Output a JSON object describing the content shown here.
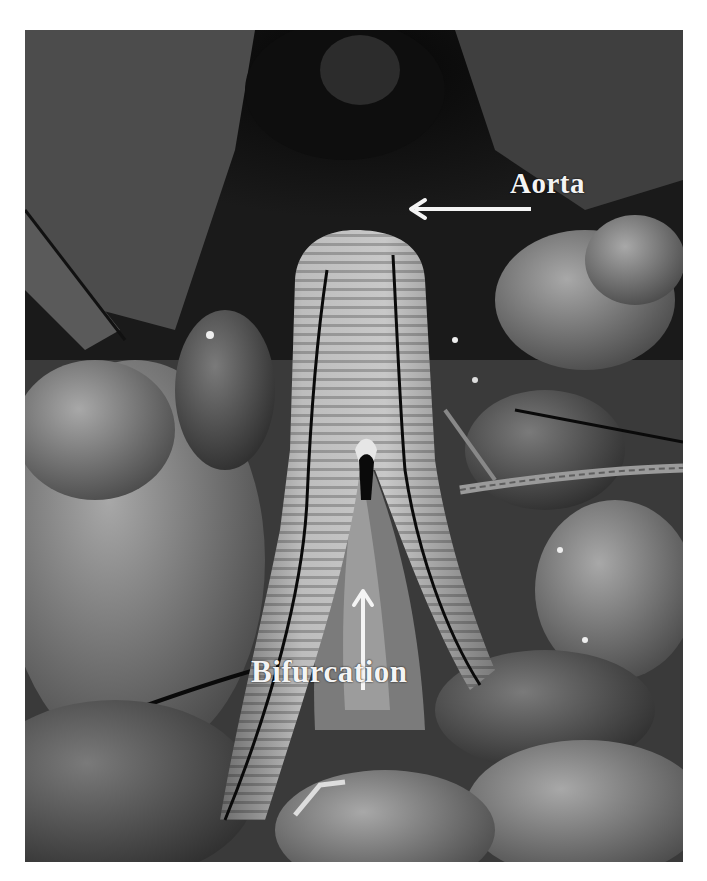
{
  "figure": {
    "type": "grayscale intraoperative photograph",
    "annotations": [
      {
        "id": "aorta",
        "text": "Aorta",
        "arrow_direction": "left"
      },
      {
        "id": "bifurcation",
        "text": "Bifurcation",
        "arrow_direction": "up"
      }
    ]
  },
  "colors": {
    "background": "#ffffff",
    "label_text": "#f4f4f4",
    "arrow": "#f4f4f4",
    "graft_light": "#b9b9b9",
    "graft_shadow": "#7a7a7a",
    "suture_line": "#0c0c0c",
    "dark_field": "#0a0a0a",
    "tissue_mid": "#6e6e6e"
  }
}
